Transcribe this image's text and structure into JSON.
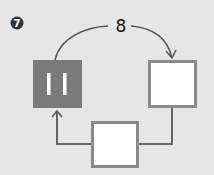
{
  "badge": {
    "label": "7",
    "color": "#333333"
  },
  "edge_label": "8",
  "nodes": [
    {
      "id": "pause",
      "fill": "#7a7a7a",
      "border": "#7a7a7a"
    },
    {
      "id": "right",
      "fill": "#ffffff",
      "border": "#8a8a8a"
    },
    {
      "id": "bottom",
      "fill": "#ffffff",
      "border": "#8a8a8a"
    }
  ],
  "colors": {
    "background": "#e6e6e6",
    "line": "#666666"
  }
}
